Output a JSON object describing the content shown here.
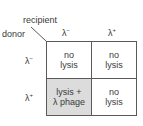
{
  "axis_labels": {
    "recipient": "recipient",
    "donor": "donor"
  },
  "columns": [
    {
      "base": "λ",
      "sup": "−"
    },
    {
      "base": "λ",
      "sup": "+"
    }
  ],
  "rows": [
    {
      "base": "λ",
      "sup": "−"
    },
    {
      "base": "λ",
      "sup": "+"
    }
  ],
  "cells": [
    [
      {
        "line1": "no",
        "line2": "lysis"
      },
      {
        "line1": "no",
        "line2": "lysis"
      }
    ],
    [
      {
        "line1": "lysis +",
        "line2": "λ phage",
        "highlight_color": "#dcdcdc"
      },
      {
        "line1": "no",
        "line2": "lysis"
      }
    ]
  ]
}
